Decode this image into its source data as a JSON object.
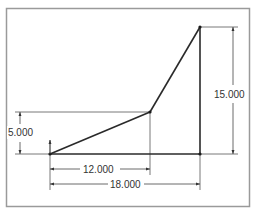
{
  "diagram": {
    "type": "cad-sketch",
    "colors": {
      "frame": "#9a9a9a",
      "geometry": "#2a2a2a",
      "dimension": "#444444",
      "text": "#333333"
    },
    "points": {
      "origin": {
        "x": 50,
        "y": 154
      },
      "mid": {
        "x": 150,
        "y": 112
      },
      "top": {
        "x": 200,
        "y": 27
      },
      "bottom_right": {
        "x": 200,
        "y": 154
      }
    },
    "dimensions": [
      {
        "id": "height-left",
        "label": "5.000",
        "orientation": "vertical"
      },
      {
        "id": "height-right",
        "label": "15.000",
        "orientation": "vertical"
      },
      {
        "id": "width-inner",
        "label": "12.000",
        "orientation": "horizontal"
      },
      {
        "id": "width-outer",
        "label": "18.000",
        "orientation": "horizontal"
      }
    ]
  }
}
